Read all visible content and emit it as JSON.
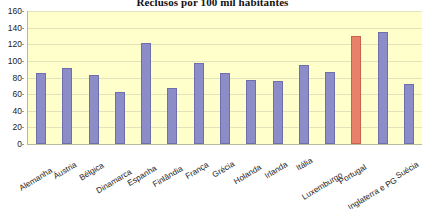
{
  "chart_data": {
    "type": "bar",
    "title": "Reclusos por 100 mil habitantes",
    "xlabel": "",
    "ylabel": "",
    "ylim": [
      0,
      160
    ],
    "ytick_step": 20,
    "yticks": [
      160,
      140,
      120,
      100,
      80,
      60,
      40,
      20,
      0
    ],
    "grid": true,
    "legend": false,
    "plot_background": "#FFFFCC",
    "bar_color": "#8C8CC8",
    "highlight_color": "#E8806A",
    "highlight_category": "Portugal",
    "categories": [
      "Alemanha",
      "Áustria",
      "Bélgica",
      "Dinamarca",
      "Espanha",
      "Finlândia",
      "França",
      "Grécia",
      "Holanda",
      "Irlanda",
      "Itália",
      "Luxemburgo",
      "Portugal",
      "Inglaterra e PG",
      "Suécia"
    ],
    "values": [
      85,
      92,
      83,
      63,
      122,
      67,
      98,
      85,
      77,
      76,
      95,
      87,
      130,
      135,
      72
    ]
  }
}
